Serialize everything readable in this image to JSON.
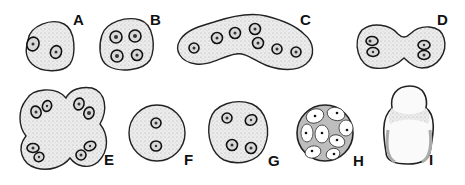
{
  "figure": {
    "type": "biological cell illustration",
    "panels": [
      {
        "label": "A",
        "description": "round cell with 2 nuclei"
      },
      {
        "label": "B",
        "description": "round cell with 4 nuclei"
      },
      {
        "label": "C",
        "description": "elongated bent cell with 7 nuclei"
      },
      {
        "label": "D",
        "description": "dumbbell-shaped dividing cell with 4 nuclei"
      },
      {
        "label": "E",
        "description": "four-lobed cell with 8 nuclei"
      },
      {
        "label": "F",
        "description": "round cell with 2 nuclei"
      },
      {
        "label": "G",
        "description": "round cell with 4 nuclei"
      },
      {
        "label": "H",
        "description": "spherical cluster of cells with dot nuclei"
      },
      {
        "label": "I",
        "description": "flask-shaped cell without visible nuclei"
      }
    ]
  },
  "colors": {
    "outline": "#222222",
    "fill": "#e6e6e6",
    "nucleus": "#333333"
  }
}
